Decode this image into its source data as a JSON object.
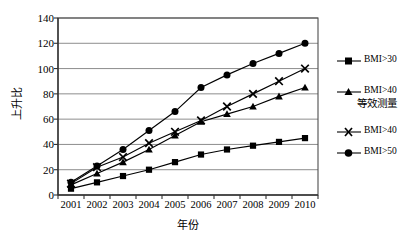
{
  "chart_data": {
    "type": "line",
    "title": "",
    "xlabel": "年份",
    "ylabel": "上升比",
    "x": [
      2001,
      2002,
      2003,
      2004,
      2005,
      2006,
      2007,
      2008,
      2009,
      2010
    ],
    "categories": [
      "2001",
      "2002",
      "2003",
      "2004",
      "2005",
      "2006",
      "2007",
      "2008",
      "2009",
      "2010"
    ],
    "ylim": [
      0,
      140
    ],
    "ytick_values": [
      0,
      20,
      40,
      60,
      80,
      100,
      120,
      140
    ],
    "ytick_labels": [
      "0",
      "20",
      "40",
      "60",
      "80",
      "100",
      "120",
      "140"
    ],
    "grid": "horizontal",
    "legend_position": "right",
    "series": [
      {
        "name": "BMI>30",
        "marker": "square",
        "color": "#000000",
        "values": [
          5,
          10,
          15,
          20,
          26,
          32,
          36,
          39,
          42,
          45
        ]
      },
      {
        "name": "BMI>40",
        "marker": "triangle",
        "color": "#000000",
        "values": [
          8,
          17,
          26,
          36,
          47,
          58,
          64,
          70,
          78,
          85
        ]
      },
      {
        "name": "BMI>40",
        "marker": "x",
        "color": "#000000",
        "values": [
          9,
          22,
          30,
          41,
          50,
          59,
          70,
          80,
          90,
          100
        ]
      },
      {
        "name": "BMI>50",
        "marker": "circle",
        "color": "#000000",
        "values": [
          10,
          23,
          36,
          51,
          66,
          85,
          95,
          104,
          112,
          120
        ]
      }
    ],
    "annotations": [
      {
        "text": "等效测量",
        "attached_to_series": 1
      }
    ]
  },
  "legend": {
    "entries": [
      {
        "label": "BMI>30",
        "marker": "square"
      },
      {
        "label": "BMI>40",
        "marker": "triangle",
        "sublabel": "等效测量"
      },
      {
        "label": "BMI>40",
        "marker": "x"
      },
      {
        "label": "BMI>50",
        "marker": "circle"
      }
    ],
    "sublabel": "等效测量"
  },
  "axes": {
    "y_title": "上升比",
    "x_title": "年份"
  },
  "style": {
    "line_color": "#1a1a1a",
    "grid_color": "#808080",
    "axis_color": "#4d4d4d",
    "plot_background": "#ffffff",
    "page_background": "#ffffff"
  }
}
